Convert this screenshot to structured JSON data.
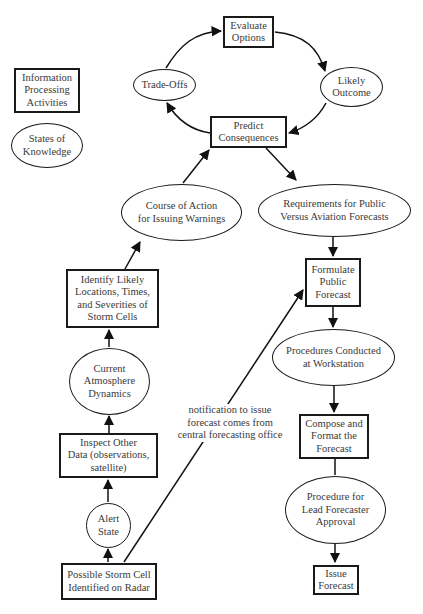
{
  "legend": {
    "activity_label": "Information\nProcessing\nActivities",
    "knowledge_label": "States of\nKnowledge"
  },
  "nodes": {
    "evaluate_options": {
      "type": "activity",
      "label": "Evaluate\nOptions"
    },
    "trade_offs": {
      "type": "knowledge",
      "label": "Trade-Offs"
    },
    "likely_outcome": {
      "type": "knowledge",
      "label": "Likely\nOutcome"
    },
    "predict_consequences": {
      "type": "activity",
      "label": "Predict\nConsequences"
    },
    "course_of_action": {
      "type": "knowledge",
      "label": "Course of Action\nfor Issuing Warnings"
    },
    "requirements": {
      "type": "knowledge",
      "label": "Requirements for Public\nVersus Aviation Forecasts"
    },
    "formulate_public_forecast": {
      "type": "activity",
      "label": "Formulate\nPublic\nForecast"
    },
    "identify_likely": {
      "type": "activity",
      "label": "Identify Likely\nLocations, Times,\nand Severities of\nStorm Cells"
    },
    "current_atmosphere": {
      "type": "knowledge",
      "label": "Current\nAtmosphere\nDynamics"
    },
    "procedures_conducted": {
      "type": "knowledge",
      "label": "Procedures Conducted\nat Workstation"
    },
    "inspect_other_data": {
      "type": "activity",
      "label": "Inspect Other\nData (observations,\nsatellite)"
    },
    "compose_format": {
      "type": "activity",
      "label": "Compose and\nFormat the\nForecast"
    },
    "alert_state": {
      "type": "knowledge",
      "label": "Alert\nState"
    },
    "lead_forecaster_approval": {
      "type": "knowledge",
      "label": "Procedure for\nLead Forecaster\nApproval"
    },
    "possible_storm_cell": {
      "type": "activity",
      "label": "Possible Storm Cell\nIdentified on Radar"
    },
    "issue_forecast": {
      "type": "activity",
      "label": "Issue\nForecast"
    }
  },
  "annotation": {
    "notification": "notification to issue\nforecast comes from\ncentral forecasting office"
  },
  "edges": [
    {
      "from": "trade_offs",
      "to": "evaluate_options"
    },
    {
      "from": "evaluate_options",
      "to": "likely_outcome"
    },
    {
      "from": "likely_outcome",
      "to": "predict_consequences"
    },
    {
      "from": "predict_consequences",
      "to": "trade_offs"
    },
    {
      "from": "course_of_action",
      "to": "predict_consequences"
    },
    {
      "from": "predict_consequences",
      "to": "requirements"
    },
    {
      "from": "requirements",
      "to": "formulate_public_forecast"
    },
    {
      "from": "identify_likely",
      "to": "course_of_action"
    },
    {
      "from": "current_atmosphere",
      "to": "identify_likely"
    },
    {
      "from": "inspect_other_data",
      "to": "current_atmosphere"
    },
    {
      "from": "alert_state",
      "to": "inspect_other_data"
    },
    {
      "from": "possible_storm_cell",
      "to": "alert_state"
    },
    {
      "from": "possible_storm_cell",
      "to": "formulate_public_forecast",
      "label": "notification"
    },
    {
      "from": "formulate_public_forecast",
      "to": "procedures_conducted"
    },
    {
      "from": "procedures_conducted",
      "to": "compose_format"
    },
    {
      "from": "compose_format",
      "to": "lead_forecaster_approval"
    },
    {
      "from": "lead_forecaster_approval",
      "to": "issue_forecast"
    }
  ]
}
